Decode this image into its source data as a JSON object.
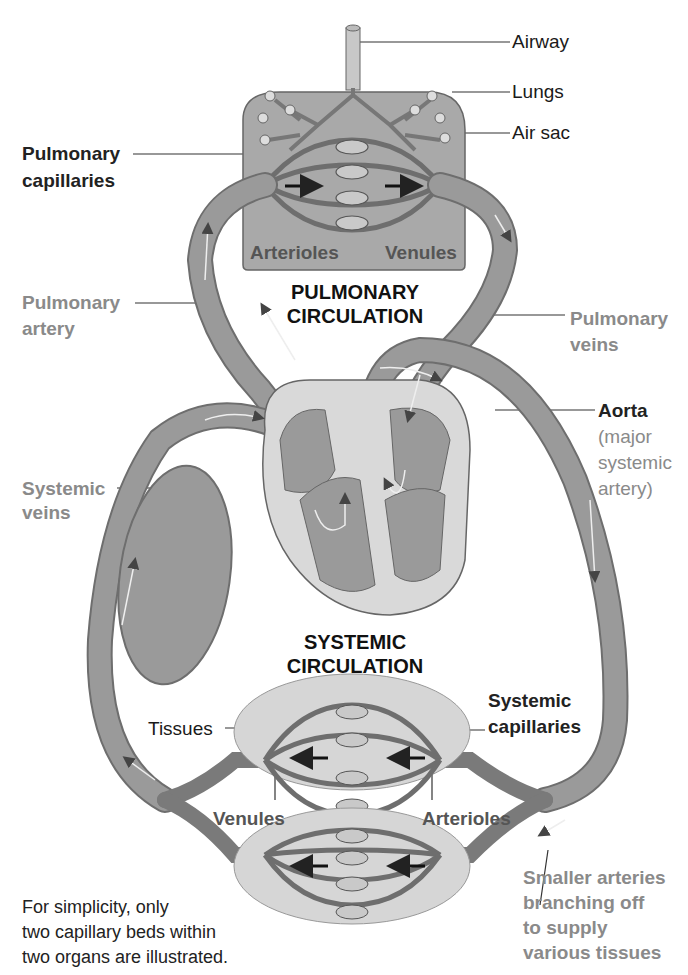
{
  "diagram": {
    "sections": {
      "pulmonary": [
        "PULMONARY",
        "CIRCULATION"
      ],
      "systemic": [
        "SYSTEMIC",
        "CIRCULATION"
      ]
    },
    "labels": {
      "airway": "Airway",
      "lungs": "Lungs",
      "air_sac": "Air sac",
      "pulmonary_capillaries": [
        "Pulmonary",
        "capillaries"
      ],
      "lung_arterioles": "Arterioles",
      "lung_venules": "Venules",
      "pulmonary_artery": [
        "Pulmonary",
        "artery"
      ],
      "pulmonary_veins": [
        "Pulmonary",
        "veins"
      ],
      "aorta": "Aorta",
      "aorta_note": [
        "(major",
        "systemic",
        "artery)"
      ],
      "systemic_veins": [
        "Systemic",
        "veins"
      ],
      "tissues": "Tissues",
      "systemic_capillaries": [
        "Systemic",
        "capillaries"
      ],
      "tissue_venules": "Venules",
      "tissue_arterioles": "Arterioles",
      "smaller_arteries": [
        "Smaller arteries",
        "branching off",
        "to supply",
        "various tissues"
      ]
    },
    "footnote": [
      "For simplicity, only",
      "two capillary beds within",
      "two organs are illustrated."
    ],
    "colors": {
      "vessel": "#8f8f8f",
      "vessel_dark": "#6e6e6e",
      "lung_box": "#a9a9a9",
      "tissue": "#d6d6d6",
      "heart_wall": "#d9d9d9",
      "label_gray": "#8a8a8a"
    }
  }
}
